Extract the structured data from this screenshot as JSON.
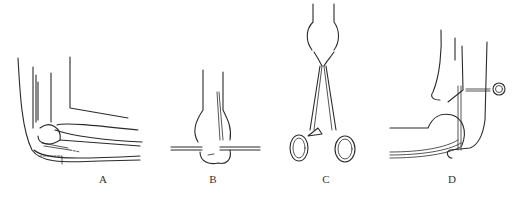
{
  "figure": {
    "panels": [
      {
        "id": "A",
        "label": "A",
        "description": "Lateral view of flexed elbow with wire passed through olecranon"
      },
      {
        "id": "B",
        "label": "B",
        "description": "Posterior view of distal humerus/olecranon with transverse wire"
      },
      {
        "id": "C",
        "label": "C",
        "description": "Forceps (towel clip) grasping olecranon"
      },
      {
        "id": "D",
        "label": "D",
        "description": "Elbow with wire loop and traction bow/screw"
      }
    ]
  }
}
